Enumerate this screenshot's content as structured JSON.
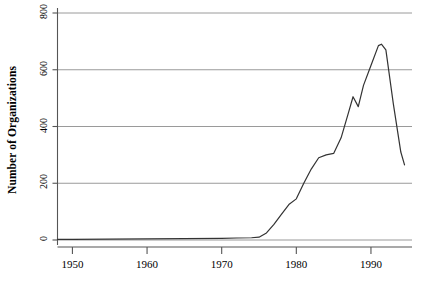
{
  "chart_data": {
    "type": "line",
    "title": "",
    "subtitle": "",
    "xlabel": "",
    "ylabel": "Number of Organizations",
    "xlim": [
      1948,
      1995.5
    ],
    "ylim": [
      0,
      800
    ],
    "xticks": [
      1950,
      1960,
      1970,
      1980,
      1990
    ],
    "xtick_labels": [
      "1950",
      "1960",
      "1970",
      "1980",
      "1990"
    ],
    "yticks": [
      0,
      200,
      400,
      600,
      800
    ],
    "ytick_labels": [
      "0",
      "200",
      "400",
      "600",
      "800"
    ],
    "grid": "horizontal",
    "legend": "none",
    "line_color": "#333333",
    "grid_color": "#9a9a9a",
    "axis_color": "#555555",
    "background": "#ffffff",
    "series": [
      {
        "name": "Number of Organizations",
        "x": [
          1948,
          1950,
          1955,
          1960,
          1965,
          1970,
          1972,
          1974,
          1975,
          1976,
          1977,
          1978,
          1979,
          1980,
          1981,
          1982,
          1983,
          1984,
          1985,
          1986,
          1987,
          1987.6,
          1988.3,
          1989,
          1990,
          1991,
          1991.4,
          1992,
          1993,
          1994,
          1994.5
        ],
        "values": [
          2,
          2,
          3,
          4,
          5,
          6,
          7,
          8,
          10,
          25,
          55,
          90,
          125,
          145,
          200,
          250,
          290,
          300,
          305,
          360,
          450,
          505,
          470,
          545,
          615,
          685,
          690,
          670,
          480,
          310,
          265
        ]
      }
    ],
    "annotations": []
  }
}
